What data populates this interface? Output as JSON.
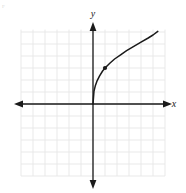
{
  "figure": {
    "name": "coordinate-plane-graph",
    "background_color": "#ffffff",
    "corner_mark": "F"
  },
  "chart_data": {
    "type": "line",
    "title": "",
    "subtitle": "",
    "xlabel": "x",
    "ylabel": "y",
    "xlim": [
      -6,
      6
    ],
    "ylim": [
      -6,
      6.2
    ],
    "grid": true,
    "grid_color": "#e6e6e6",
    "grid_step": 1,
    "axis_color": "#1a1a1a",
    "curve_color": "#1a1a1a",
    "legend": null,
    "legend_position": "none",
    "x_tick_labels": [],
    "y_tick_labels": [],
    "axes": [
      {
        "name": "x-axis",
        "label": "x",
        "arrows": "both",
        "from": [
          -6.1,
          0
        ],
        "to": [
          6.2,
          0
        ]
      },
      {
        "name": "y-axis",
        "label": "y",
        "arrows": "both",
        "from": [
          0,
          -6.5
        ],
        "to": [
          0,
          6.6
        ]
      }
    ],
    "series": [
      {
        "name": "radical-curve",
        "type": "line",
        "color": "#1a1a1a",
        "description": "increasing concave-down radical curve from the origin",
        "x": [
          0,
          0.08,
          0.2,
          0.35,
          0.55,
          0.8,
          1,
          1.4,
          1.8,
          2.3,
          2.8,
          3.4,
          4,
          4.6,
          5,
          5.4
        ],
        "y": [
          0,
          1.05,
          1.55,
          1.95,
          2.35,
          2.75,
          3,
          3.4,
          3.75,
          4.1,
          4.45,
          4.8,
          5.15,
          5.5,
          5.75,
          6.05
        ]
      }
    ],
    "points": [
      {
        "name": "marked-point",
        "x": 1,
        "y": 3,
        "marker": "filled-circle",
        "color": "#1a1a1a",
        "label": ""
      }
    ]
  }
}
